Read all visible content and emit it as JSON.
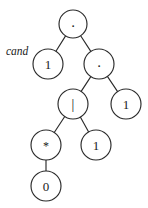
{
  "figure": {
    "background_color": "#ffffff",
    "stroke_color": "#2b2b2b",
    "text_color": "#1a1a1a",
    "width": 148,
    "height": 208
  },
  "chart_data": {
    "type": "diagram",
    "subtype": "binary-syntax-tree",
    "title": "",
    "nodes": [
      {
        "id": "n0",
        "label": ".",
        "kind": "operator",
        "role": "concatenation",
        "cx": 73,
        "cy": 24,
        "r": 14
      },
      {
        "id": "n1",
        "label": "1",
        "kind": "leaf",
        "role": "symbol",
        "cx": 48,
        "cy": 64,
        "r": 15
      },
      {
        "id": "n2",
        "label": ".",
        "kind": "operator",
        "role": "concatenation",
        "cx": 99,
        "cy": 64,
        "r": 15
      },
      {
        "id": "n3",
        "label": "|",
        "kind": "operator",
        "role": "alternation",
        "cx": 73,
        "cy": 104,
        "r": 15
      },
      {
        "id": "n4",
        "label": "1",
        "kind": "leaf",
        "role": "symbol",
        "cx": 126,
        "cy": 104,
        "r": 15
      },
      {
        "id": "n5",
        "label": "*",
        "kind": "operator",
        "role": "kleene-star",
        "cx": 46,
        "cy": 145,
        "r": 15
      },
      {
        "id": "n6",
        "label": "1",
        "kind": "leaf",
        "role": "symbol",
        "cx": 96,
        "cy": 145,
        "r": 15
      },
      {
        "id": "n7",
        "label": "0",
        "kind": "leaf",
        "role": "symbol",
        "cx": 46,
        "cy": 186,
        "r": 15
      }
    ],
    "edges": [
      {
        "from": "n0",
        "to": "n1"
      },
      {
        "from": "n0",
        "to": "n2"
      },
      {
        "from": "n2",
        "to": "n3"
      },
      {
        "from": "n2",
        "to": "n4"
      },
      {
        "from": "n3",
        "to": "n5"
      },
      {
        "from": "n3",
        "to": "n6"
      },
      {
        "from": "n5",
        "to": "n7"
      }
    ],
    "annotations": [
      {
        "id": "a0",
        "text": "cand",
        "target": "n1",
        "x": 6,
        "y": 51,
        "style": "italic"
      }
    ]
  },
  "labels": {
    "root_operator": ".",
    "second_operator": ".",
    "alternation_operator": "|",
    "star_operator": "*",
    "leaf_left": "1",
    "leaf_right": "1",
    "leaf_mid": "1",
    "leaf_bottom": "0",
    "annotation_cand": "cand"
  }
}
